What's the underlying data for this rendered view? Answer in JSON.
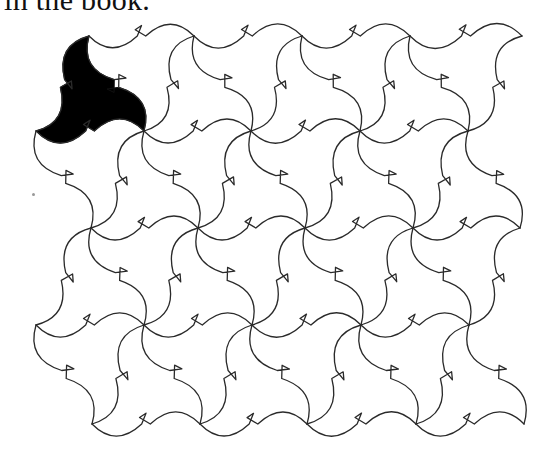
{
  "caption": {
    "text": "in the book."
  },
  "figure": {
    "type": "triangular-bird-tessellation",
    "stroke_color": "#2a2a2a",
    "highlight_color": "#000000",
    "rows": [
      {
        "y": 36,
        "xs": [
          89,
          194,
          302,
          410,
          522
        ]
      },
      {
        "y": 131,
        "xs": [
          36,
          144,
          251,
          360,
          468
        ]
      },
      {
        "y": 228,
        "xs": [
          91,
          198,
          305,
          413,
          520
        ]
      },
      {
        "y": 325,
        "xs": [
          36,
          144,
          252,
          361,
          469
        ]
      },
      {
        "y": 424,
        "xs": [
          92,
          200,
          307,
          416,
          524
        ]
      }
    ],
    "highlighted_tile": {
      "row": 0,
      "index": 0,
      "label": "shaded-bird-tile"
    }
  }
}
